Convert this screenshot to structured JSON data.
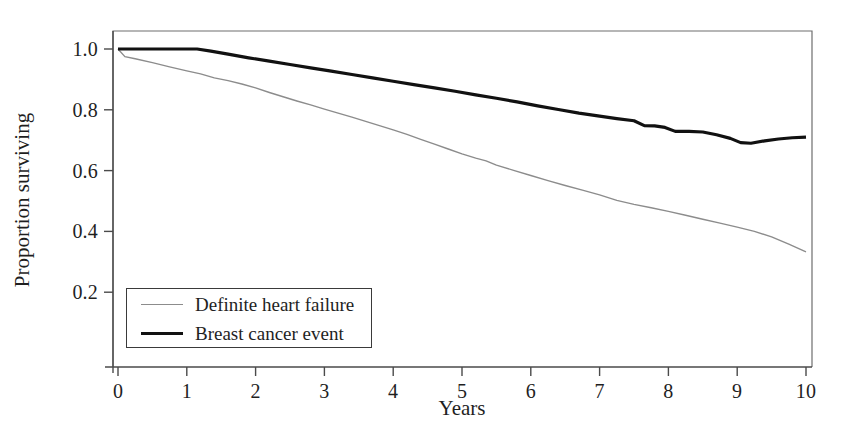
{
  "chart_data": {
    "type": "line",
    "title": "",
    "xlabel": "Years",
    "ylabel": "Proportion surviving",
    "xlim": [
      0,
      10
    ],
    "ylim": [
      0,
      1.05
    ],
    "xticks": [
      "0",
      "1",
      "2",
      "3",
      "4",
      "5",
      "6",
      "7",
      "8",
      "9",
      "10"
    ],
    "xtick_values": [
      0,
      1,
      2,
      3,
      4,
      5,
      6,
      7,
      8,
      9,
      10
    ],
    "yticks": [
      "0.2",
      "0.4",
      "0.6",
      "0.8",
      "1.0"
    ],
    "ytick_values": [
      0.2,
      0.4,
      0.6,
      0.8,
      1.0
    ],
    "grid": false,
    "legend_position": "lower left",
    "series": [
      {
        "name": "Definite heart failure",
        "color": "#8c8c8c",
        "linewidth": 1.4,
        "x": [
          0.0,
          0.1,
          0.25,
          0.5,
          0.75,
          1.0,
          1.2,
          1.4,
          1.6,
          1.8,
          2.0,
          2.2,
          2.4,
          2.6,
          2.8,
          3.0,
          3.2,
          3.4,
          3.6,
          3.8,
          4.0,
          4.2,
          4.4,
          4.6,
          4.8,
          5.0,
          5.2,
          5.35,
          5.5,
          5.75,
          6.0,
          6.25,
          6.5,
          6.75,
          7.0,
          7.25,
          7.5,
          7.75,
          8.0,
          8.25,
          8.5,
          8.75,
          9.0,
          9.25,
          9.5,
          9.75,
          10.0
        ],
        "y": [
          1.0,
          0.975,
          0.968,
          0.955,
          0.941,
          0.928,
          0.918,
          0.905,
          0.896,
          0.885,
          0.872,
          0.857,
          0.843,
          0.829,
          0.816,
          0.802,
          0.789,
          0.776,
          0.762,
          0.748,
          0.734,
          0.719,
          0.703,
          0.687,
          0.671,
          0.655,
          0.641,
          0.632,
          0.618,
          0.601,
          0.584,
          0.567,
          0.551,
          0.536,
          0.52,
          0.502,
          0.489,
          0.478,
          0.466,
          0.453,
          0.44,
          0.427,
          0.414,
          0.4,
          0.382,
          0.358,
          0.333
        ]
      },
      {
        "name": "Breast cancer event",
        "color": "#111111",
        "linewidth": 3.2,
        "x": [
          0.0,
          0.3,
          0.6,
          0.9,
          1.15,
          1.35,
          1.6,
          1.9,
          2.2,
          2.5,
          2.8,
          3.1,
          3.4,
          3.7,
          4.0,
          4.3,
          4.6,
          4.9,
          5.2,
          5.5,
          5.8,
          6.1,
          6.4,
          6.7,
          7.0,
          7.25,
          7.5,
          7.65,
          7.8,
          7.95,
          8.1,
          8.3,
          8.5,
          8.7,
          8.9,
          9.05,
          9.2,
          9.4,
          9.6,
          9.8,
          10.0
        ],
        "y": [
          1.0,
          1.0,
          1.0,
          1.0,
          1.0,
          0.993,
          0.983,
          0.971,
          0.96,
          0.949,
          0.938,
          0.927,
          0.916,
          0.905,
          0.894,
          0.883,
          0.872,
          0.861,
          0.849,
          0.838,
          0.826,
          0.813,
          0.801,
          0.789,
          0.779,
          0.771,
          0.764,
          0.748,
          0.747,
          0.742,
          0.729,
          0.729,
          0.727,
          0.718,
          0.706,
          0.692,
          0.69,
          0.698,
          0.704,
          0.708,
          0.71
        ]
      }
    ]
  },
  "axes": {
    "legend_entries": [
      {
        "label": "Definite heart failure"
      },
      {
        "label": "Breast cancer event"
      }
    ]
  },
  "colors": {
    "axis": "#4a4a4a",
    "frame": "#6e6e6e",
    "series_gray": "#8c8c8c",
    "series_black": "#111111",
    "background": "#ffffff"
  }
}
